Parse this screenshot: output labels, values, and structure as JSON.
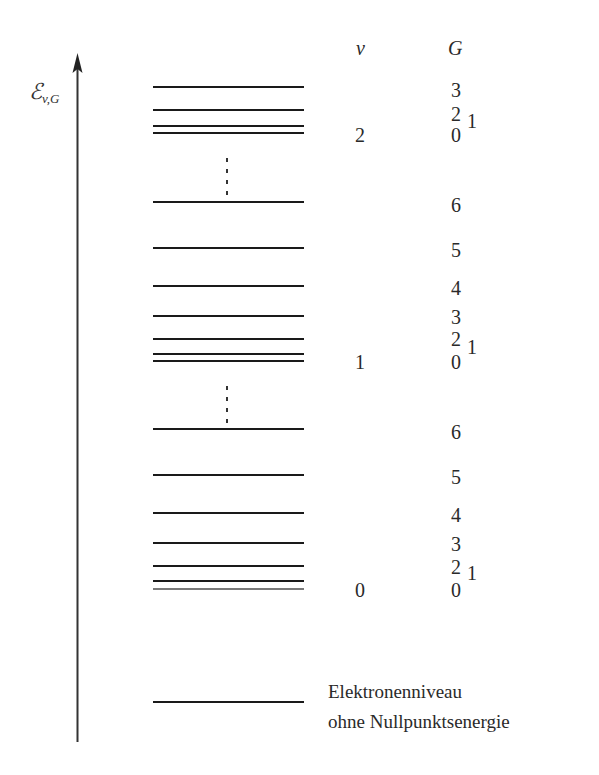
{
  "axis": {
    "label_main": "ℰ",
    "label_sub": "v,G",
    "direction": "up"
  },
  "headers": {
    "v": "v",
    "G": "G"
  },
  "caption": {
    "line1": "Elektronenniveau",
    "line2": "ohne Nullpunktsenergie"
  },
  "colors": {
    "line": "#1a1a1a",
    "ground_line": "#7a7a7a",
    "text": "#2a2a2a"
  },
  "groups": [
    {
      "v": "2",
      "v_y": 140,
      "levels": [
        {
          "G": "0",
          "y": 133
        },
        {
          "G": "1",
          "y": 126
        },
        {
          "G": "2",
          "y": 110
        },
        {
          "G": "3",
          "y": 87
        }
      ],
      "labels": [
        {
          "text": "3",
          "x": 451,
          "y": 95
        },
        {
          "text": "2",
          "x": 451,
          "y": 119
        },
        {
          "text": "1",
          "x": 467,
          "y": 126
        },
        {
          "text": "0",
          "x": 451,
          "y": 140
        }
      ]
    },
    {
      "v": "1",
      "v_y": 367,
      "levels": [
        {
          "G": "0",
          "y": 361
        },
        {
          "G": "1",
          "y": 354
        },
        {
          "G": "2",
          "y": 339
        },
        {
          "G": "3",
          "y": 316
        },
        {
          "G": "4",
          "y": 286
        },
        {
          "G": "5",
          "y": 248
        },
        {
          "G": "6",
          "y": 202
        }
      ],
      "labels": [
        {
          "text": "6",
          "x": 451,
          "y": 210
        },
        {
          "text": "5",
          "x": 451,
          "y": 255
        },
        {
          "text": "4",
          "x": 451,
          "y": 293
        },
        {
          "text": "3",
          "x": 451,
          "y": 322
        },
        {
          "text": "2",
          "x": 451,
          "y": 344
        },
        {
          "text": "1",
          "x": 467,
          "y": 352
        },
        {
          "text": "0",
          "x": 451,
          "y": 367
        }
      ],
      "dots_above_y": [
        160,
        171,
        182,
        193
      ]
    },
    {
      "v": "0",
      "v_y": 595,
      "levels": [
        {
          "G": "0",
          "y": 589,
          "gray": true
        },
        {
          "G": "1",
          "y": 581
        },
        {
          "G": "2",
          "y": 566
        },
        {
          "G": "3",
          "y": 543
        },
        {
          "G": "4",
          "y": 513
        },
        {
          "G": "5",
          "y": 475
        },
        {
          "G": "6",
          "y": 429
        }
      ],
      "labels": [
        {
          "text": "6",
          "x": 451,
          "y": 437
        },
        {
          "text": "5",
          "x": 451,
          "y": 482
        },
        {
          "text": "4",
          "x": 451,
          "y": 520
        },
        {
          "text": "3",
          "x": 451,
          "y": 549
        },
        {
          "text": "2",
          "x": 451,
          "y": 572
        },
        {
          "text": "1",
          "x": 467,
          "y": 578
        },
        {
          "text": "0",
          "x": 451,
          "y": 595
        }
      ],
      "dots_above_y": [
        388,
        399,
        410,
        421
      ]
    }
  ],
  "electron_level_y": 702
}
